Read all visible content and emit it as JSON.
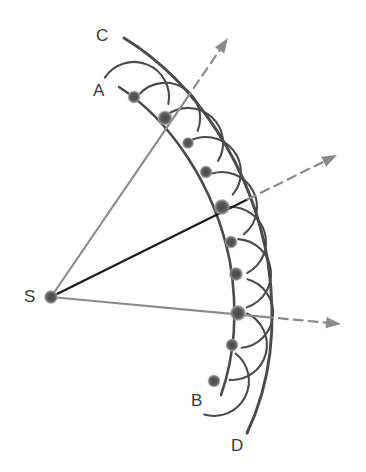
{
  "figure": {
    "background_color": "#ffffff"
  },
  "colors": {
    "wavefront_stroke": "#4b4b4b",
    "wavelet_stroke": "#4b4b4b",
    "envelope_stroke": "#4b4b4b",
    "dot_fill": "#555555",
    "dot_halo": "#8f8f8f",
    "ray_gray": "#8c8c8c",
    "ray_black": "#1a1a1a",
    "label_color": "#3a3a3a"
  },
  "labels": [
    {
      "name": "label-c",
      "text": "C",
      "x": 96,
      "y": 27
    },
    {
      "name": "label-a",
      "text": "A",
      "x": 93,
      "y": 82
    },
    {
      "name": "label-s",
      "text": "S",
      "x": 24,
      "y": 288
    },
    {
      "name": "label-b",
      "text": "B",
      "x": 191,
      "y": 392
    },
    {
      "name": "label-d",
      "text": "D",
      "x": 231,
      "y": 437
    }
  ],
  "source": {
    "name": "source-point-s",
    "label": "S",
    "x": 51,
    "y": 297,
    "radius": 7
  },
  "wavefront_ab": {
    "label_start": "A",
    "label_end": "B",
    "description": "original spherical wavefront AB centered on S",
    "arc_start": {
      "x": 119,
      "y": 87
    },
    "arc_end": {
      "x": 221,
      "y": 395
    },
    "points": [
      {
        "x": 134,
        "y": 97,
        "r": 6.5
      },
      {
        "x": 165,
        "y": 118,
        "r": 7.5
      },
      {
        "x": 188,
        "y": 143,
        "r": 6.0
      },
      {
        "x": 206,
        "y": 172,
        "r": 6.5
      },
      {
        "x": 222,
        "y": 207,
        "r": 8.0
      },
      {
        "x": 231,
        "y": 242,
        "r": 6.5
      },
      {
        "x": 236,
        "y": 274,
        "r": 7.0
      },
      {
        "x": 238,
        "y": 313,
        "r": 8.0
      },
      {
        "x": 232,
        "y": 345,
        "r": 6.5
      },
      {
        "x": 214,
        "y": 381,
        "r": 6.5
      }
    ]
  },
  "envelope_cd": {
    "label_start": "C",
    "label_end": "D",
    "description": "new wavefront CD as the envelope of the secondary wavelets",
    "arc_start": {
      "x": 124,
      "y": 38
    },
    "arc_end": {
      "x": 247,
      "y": 433
    }
  },
  "wavelets": {
    "description": "secondary spherical wavelets radiating from each point of AB",
    "radius": 35,
    "count": 10
  },
  "rays": [
    {
      "name": "ray-upper",
      "style": "solid-gray-with-dashed-arrow",
      "color": "#8c8c8c",
      "from": {
        "x": 51,
        "y": 297
      },
      "through": {
        "x": 165,
        "y": 118
      },
      "arrow_tip": {
        "x": 228,
        "y": 38
      }
    },
    {
      "name": "ray-middle",
      "style": "solid-black-with-dashed-arrow",
      "color": "#1a1a1a",
      "from": {
        "x": 51,
        "y": 297
      },
      "through": {
        "x": 222,
        "y": 207
      },
      "arrow_tip": {
        "x": 337,
        "y": 155
      }
    },
    {
      "name": "ray-lower",
      "style": "solid-gray-with-dashed-arrow",
      "color": "#8c8c8c",
      "from": {
        "x": 51,
        "y": 297
      },
      "through": {
        "x": 238,
        "y": 313
      },
      "arrow_tip": {
        "x": 341,
        "y": 324
      }
    }
  ]
}
